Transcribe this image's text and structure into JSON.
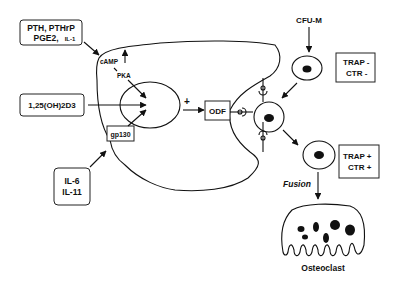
{
  "diagram": {
    "colors": {
      "ink": "#111111",
      "background": "#ffffff"
    },
    "stimuli": {
      "pth_box": {
        "line1": "PTH, PTHrP",
        "line2_main": "PGE2,",
        "line2_small": "IL-1"
      },
      "vitd_box": {
        "label": "1,25(OH)2D3"
      },
      "il_box": {
        "line1": "IL-6",
        "line2": "IL-11"
      }
    },
    "stromal_cell": {
      "camp": "cAMP",
      "pka": "PKA",
      "gp130": "gp130",
      "plus": "+",
      "odf": "ODF"
    },
    "progenitor": {
      "cfu": "CFU-M",
      "marker_neg": {
        "line1": "TRAP -",
        "line2": "CTR -"
      },
      "marker_pos": {
        "line1": "TRAP +",
        "line2": "CTR +"
      },
      "fusion": "Fusion",
      "osteoclast": "Osteoclast"
    }
  }
}
